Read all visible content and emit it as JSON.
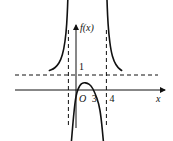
{
  "chart_data": {
    "type": "line",
    "title": "",
    "xlabel": "x",
    "ylabel": "f(x)",
    "origin_label": "O",
    "x_tick_labels": [
      "3",
      "4"
    ],
    "y_tick_labels": [
      "1"
    ],
    "asymptotes": {
      "vertical": [
        -1,
        4
      ],
      "horizontal": [
        1
      ]
    },
    "xlim": [
      -3.8,
      6.2
    ],
    "ylim": [
      -3.6,
      6.2
    ],
    "series": [
      {
        "name": "left-branch",
        "x": [
          -3.5,
          -3.0,
          -2.5,
          -2.0,
          -1.6,
          -1.3,
          -1.15,
          -1.08
        ],
        "y": [
          1.3,
          1.4,
          1.6,
          2.0,
          2.7,
          3.8,
          5.0,
          6.0
        ]
      },
      {
        "name": "middle-branch",
        "x": [
          -0.6,
          -0.3,
          0.0,
          0.5,
          1.0,
          1.5,
          2.0,
          2.5,
          3.0,
          3.3,
          3.6
        ],
        "y": [
          -3.4,
          -1.6,
          -0.3,
          0.35,
          0.5,
          0.45,
          0.3,
          -0.2,
          -0.9,
          -1.8,
          -3.4
        ]
      },
      {
        "name": "right-branch",
        "x": [
          4.08,
          4.15,
          4.3,
          4.6,
          5.0,
          5.5,
          6.0
        ],
        "y": [
          6.0,
          5.0,
          3.8,
          2.6,
          1.9,
          1.5,
          1.3
        ]
      }
    ]
  }
}
